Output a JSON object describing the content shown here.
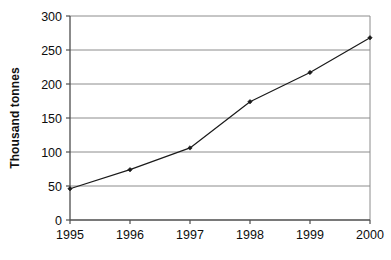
{
  "chart_data": {
    "type": "line",
    "title": "",
    "xlabel": "",
    "ylabel": "Thousand tonnes",
    "categories": [
      "1995",
      "1996",
      "1997",
      "1998",
      "1999",
      "2000"
    ],
    "x": [
      1995,
      1996,
      1997,
      1998,
      1999,
      2000
    ],
    "values": [
      46,
      74,
      106,
      174,
      217,
      268
    ],
    "series": [
      {
        "name": "Thousand tonnes",
        "values": [
          46,
          74,
          106,
          174,
          217,
          268
        ]
      }
    ],
    "xlim": [
      1995,
      2000
    ],
    "ylim": [
      0,
      300
    ],
    "ytick_labels": [
      "0",
      "50",
      "100",
      "150",
      "200",
      "250",
      "300"
    ],
    "ytick_values": [
      0,
      50,
      100,
      150,
      200,
      250,
      300
    ],
    "xtick_labels": [
      "1995",
      "1996",
      "1997",
      "1998",
      "1999",
      "2000"
    ],
    "grid": true,
    "grid_axis": "y",
    "legend": false,
    "legend_position": "none",
    "marker": "diamond",
    "line_color": "#1a1a1a",
    "marker_color": "#1a1a1a",
    "grid_color": "#8c8c8c",
    "axis_color": "#555555",
    "plot_background": "#ffffff"
  }
}
